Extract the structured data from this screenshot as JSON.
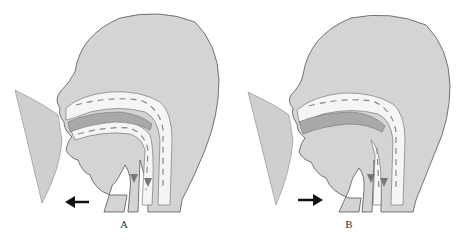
{
  "figure": {
    "panels": [
      {
        "id": "A",
        "label": "A",
        "arrow_direction": "left",
        "description": "Infant breastfeeding cross-section; jaw moves backward"
      },
      {
        "id": "B",
        "label": "B",
        "arrow_direction": "right",
        "description": "Infant breastfeeding cross-section; jaw moves forward"
      }
    ],
    "colors": {
      "head_fill": "#d4d4d4",
      "breast_fill": "#cfcfcf",
      "airway_fill": "#f5f5f5",
      "tongue_fill": "#a9a9a9",
      "outline": "#555555",
      "arrow": "#111111",
      "flow_dash": "#888888"
    }
  }
}
